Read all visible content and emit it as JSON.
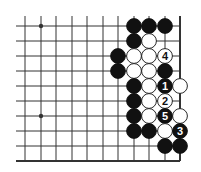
{
  "diagram": {
    "colors": {
      "background": "#ffffff",
      "line": "#333333",
      "black_stone": "#111111",
      "white_stone": "#ffffff"
    },
    "grid": {
      "cols_x": [
        25,
        41,
        56,
        72,
        87,
        103,
        118,
        134,
        149,
        165,
        180
      ],
      "rows_y": [
        26,
        41,
        56,
        71,
        86,
        101,
        116,
        131,
        146,
        161
      ],
      "line_left": 16,
      "line_top": 16,
      "right_edge_col": 10,
      "bottom_edge_row": 9
    },
    "star_points": [
      {
        "col": 1,
        "row": 0
      },
      {
        "col": 1,
        "row": 6
      }
    ],
    "stones": [
      {
        "col": 7,
        "row": 0,
        "color": "black",
        "label": ""
      },
      {
        "col": 8,
        "row": 0,
        "color": "black",
        "label": ""
      },
      {
        "col": 9,
        "row": 0,
        "color": "black",
        "label": ""
      },
      {
        "col": 7,
        "row": 1,
        "color": "black",
        "label": ""
      },
      {
        "col": 8,
        "row": 1,
        "color": "white",
        "label": ""
      },
      {
        "col": 6,
        "row": 2,
        "color": "black",
        "label": ""
      },
      {
        "col": 7,
        "row": 2,
        "color": "white",
        "label": ""
      },
      {
        "col": 8,
        "row": 2,
        "color": "white",
        "label": ""
      },
      {
        "col": 9,
        "row": 2,
        "color": "white",
        "label": "4"
      },
      {
        "col": 6,
        "row": 3,
        "color": "black",
        "label": ""
      },
      {
        "col": 7,
        "row": 3,
        "color": "white",
        "label": ""
      },
      {
        "col": 8,
        "row": 3,
        "color": "white",
        "label": ""
      },
      {
        "col": 9,
        "row": 3,
        "color": "black",
        "label": ""
      },
      {
        "col": 7,
        "row": 4,
        "color": "black",
        "label": ""
      },
      {
        "col": 8,
        "row": 4,
        "color": "white",
        "label": ""
      },
      {
        "col": 9,
        "row": 4,
        "color": "black",
        "label": "1"
      },
      {
        "col": 10,
        "row": 4,
        "color": "white",
        "label": ""
      },
      {
        "col": 7,
        "row": 5,
        "color": "black",
        "label": ""
      },
      {
        "col": 8,
        "row": 5,
        "color": "white",
        "label": ""
      },
      {
        "col": 9,
        "row": 5,
        "color": "white",
        "label": "2"
      },
      {
        "col": 7,
        "row": 6,
        "color": "black",
        "label": ""
      },
      {
        "col": 8,
        "row": 6,
        "color": "white",
        "label": ""
      },
      {
        "col": 9,
        "row": 6,
        "color": "black",
        "label": "5"
      },
      {
        "col": 10,
        "row": 6,
        "color": "white",
        "label": ""
      },
      {
        "col": 7,
        "row": 7,
        "color": "black",
        "label": ""
      },
      {
        "col": 8,
        "row": 7,
        "color": "black",
        "label": ""
      },
      {
        "col": 9,
        "row": 7,
        "color": "white",
        "label": ""
      },
      {
        "col": 10,
        "row": 7,
        "color": "black",
        "label": "3"
      },
      {
        "col": 9,
        "row": 8,
        "color": "black",
        "label": ""
      },
      {
        "col": 10,
        "row": 8,
        "color": "black",
        "label": ""
      }
    ]
  }
}
